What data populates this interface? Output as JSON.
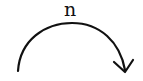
{
  "diagram": {
    "label": "n",
    "arrow": {
      "shape": "curved-arc",
      "direction": "clockwise",
      "color": "#111111"
    }
  }
}
